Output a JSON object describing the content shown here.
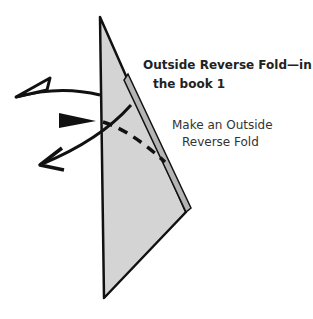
{
  "diagram": {
    "title_line1": "Outside Reverse Fold—in",
    "title_line2": "the book 1",
    "instruction_line1": "Make an Outside",
    "instruction_line2": "Reverse Fold",
    "colors": {
      "paper": "#d4d4d4",
      "paper_edge": "#b8b8b8",
      "ink": "#111111"
    }
  }
}
